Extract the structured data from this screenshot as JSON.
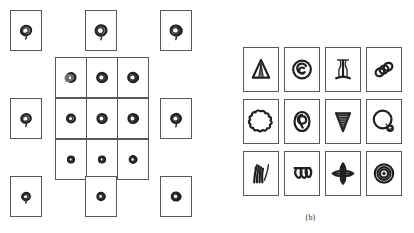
{
  "figure": {
    "background_color": "#ffffff",
    "ink_color": "#202020",
    "cell_border_color": "#585858",
    "panels": [
      {
        "id": "a",
        "caption": "(a)",
        "description": "Sparse 5x5 arrangement of small framed thumbnails showing one rotating disk/torus object at many viewpoints",
        "cell_width": 32,
        "cell_height": 41,
        "cells": [
          {
            "name": "disk-view-r1c1",
            "row": 1,
            "col": 1,
            "x": 10,
            "y": 10,
            "glyph": "disk-tilt-a",
            "label": ""
          },
          {
            "name": "disk-view-r1c3",
            "row": 1,
            "col": 3,
            "x": 85,
            "y": 10,
            "glyph": "disk-tilt-b",
            "label": ""
          },
          {
            "name": "disk-view-r1c5",
            "row": 1,
            "col": 5,
            "x": 160,
            "y": 10,
            "glyph": "disk-tilt-c",
            "label": ""
          },
          {
            "name": "disk-view-r2c2",
            "row": 2,
            "col": 2,
            "x": 55,
            "y": 57,
            "glyph": "disk-rings",
            "label": ""
          },
          {
            "name": "disk-view-r2c3",
            "row": 2,
            "col": 3,
            "x": 86,
            "y": 57,
            "glyph": "disk-tilt-d",
            "label": ""
          },
          {
            "name": "disk-view-r2c4",
            "row": 2,
            "col": 4,
            "x": 117,
            "y": 57,
            "glyph": "disk-tilt-e",
            "label": ""
          },
          {
            "name": "disk-view-r3c1",
            "row": 3,
            "col": 1,
            "x": 10,
            "y": 98,
            "glyph": "disk-tilt-f",
            "label": ""
          },
          {
            "name": "disk-view-r3c2",
            "row": 3,
            "col": 2,
            "x": 55,
            "y": 98,
            "glyph": "disk-open",
            "label": ""
          },
          {
            "name": "disk-view-r3c3",
            "row": 3,
            "col": 3,
            "x": 86,
            "y": 98,
            "glyph": "disk-tilt-g",
            "label": ""
          },
          {
            "name": "disk-view-r3c4",
            "row": 3,
            "col": 4,
            "x": 117,
            "y": 98,
            "glyph": "disk-tilt-h",
            "label": ""
          },
          {
            "name": "disk-view-r3c5",
            "row": 3,
            "col": 5,
            "x": 160,
            "y": 98,
            "glyph": "disk-tilt-i",
            "label": ""
          },
          {
            "name": "disk-view-r4c2",
            "row": 4,
            "col": 2,
            "x": 55,
            "y": 139,
            "glyph": "disk-small-a",
            "label": ""
          },
          {
            "name": "disk-view-r4c3",
            "row": 4,
            "col": 3,
            "x": 86,
            "y": 139,
            "glyph": "disk-small-b",
            "label": ""
          },
          {
            "name": "disk-view-r4c4",
            "row": 4,
            "col": 4,
            "x": 117,
            "y": 139,
            "glyph": "disk-small-c",
            "label": ""
          },
          {
            "name": "disk-view-r5c1",
            "row": 5,
            "col": 1,
            "x": 10,
            "y": 176,
            "glyph": "disk-tilt-j",
            "label": ""
          },
          {
            "name": "disk-view-r5c3",
            "row": 5,
            "col": 3,
            "x": 85,
            "y": 176,
            "glyph": "disk-tilt-k",
            "label": ""
          },
          {
            "name": "disk-view-r5c5",
            "row": 5,
            "col": 5,
            "x": 160,
            "y": 176,
            "glyph": "disk-tilt-l",
            "label": ""
          }
        ]
      },
      {
        "id": "b",
        "caption": "(b)",
        "description": "Dense 4x3 grid of framed thumbnails, each containing a different line-drawn shape",
        "cell_width": 36,
        "cell_height": 45,
        "origin_x": 243,
        "origin_y": 47,
        "col_step": 41,
        "row_step": 52,
        "cells": [
          {
            "name": "shape-triangle-spike",
            "row": 1,
            "col": 1,
            "glyph": "triangle-spike",
            "label": "triangle with inner spike"
          },
          {
            "name": "shape-spiral-circle",
            "row": 1,
            "col": 2,
            "glyph": "spiral-circle",
            "label": "circle with inner spiral"
          },
          {
            "name": "shape-pillar",
            "row": 1,
            "col": 3,
            "glyph": "pillar",
            "label": "vertical pillar with flared ends"
          },
          {
            "name": "shape-three-rings",
            "row": 1,
            "col": 4,
            "glyph": "three-rings",
            "label": "three overlapping rings"
          },
          {
            "name": "shape-cloud",
            "row": 2,
            "col": 1,
            "glyph": "cloud",
            "label": "scalloped cloud blob"
          },
          {
            "name": "shape-oval-loop",
            "row": 2,
            "col": 2,
            "glyph": "oval-loop",
            "label": "oval with inner loop"
          },
          {
            "name": "shape-cone-spiral",
            "row": 2,
            "col": 3,
            "glyph": "cone-spiral",
            "label": "tapered spiral cone"
          },
          {
            "name": "shape-balloon",
            "row": 2,
            "col": 4,
            "glyph": "balloon",
            "label": "large circle with small knot"
          },
          {
            "name": "shape-grass-strokes",
            "row": 3,
            "col": 1,
            "glyph": "grass-strokes",
            "label": "bundle of grass strokes"
          },
          {
            "name": "shape-triple-coil",
            "row": 3,
            "col": 2,
            "glyph": "triple-coil",
            "label": "three hanging coils"
          },
          {
            "name": "shape-four-petal",
            "row": 3,
            "col": 3,
            "glyph": "four-petal",
            "label": "four-petal cross rosette"
          },
          {
            "name": "shape-target-rings",
            "row": 3,
            "col": 4,
            "glyph": "target-rings",
            "label": "concentric target rings"
          }
        ]
      }
    ]
  }
}
